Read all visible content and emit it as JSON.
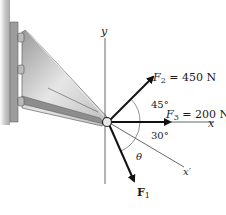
{
  "diagram": {
    "axes": {
      "y_label": "y",
      "x_label": "x",
      "x_prime_label": "x′"
    },
    "forces": [
      {
        "name": "F2",
        "label_prefix": "F",
        "subscript": "2",
        "value_text": " = 450 N",
        "angle_label": "45°"
      },
      {
        "name": "F3",
        "label_prefix": "F",
        "subscript": "3",
        "value_text": " = 200 N"
      },
      {
        "name": "F1",
        "label_prefix": "F",
        "subscript": "1",
        "value_text": ""
      }
    ],
    "angles": {
      "f2_from_x": "45°",
      "xprime_from_x": "30°",
      "theta": "θ"
    },
    "colors": {
      "arrow": "#111111",
      "axis": "#555555",
      "bracket_light": "#d9d9d9",
      "bracket_dark": "#8a8a8a",
      "wall": "#b8b8b8"
    }
  }
}
